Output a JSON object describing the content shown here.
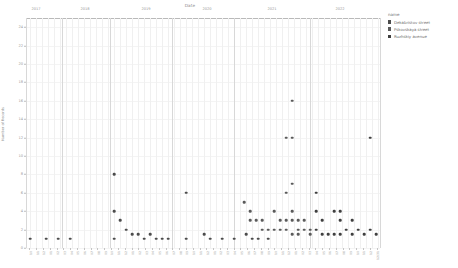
{
  "chart_title": "Date",
  "legend": {
    "title": "name",
    "items": [
      {
        "label": "Dekabristov street",
        "color": "#4c4c4c"
      },
      {
        "label": "Pskovskaya street",
        "color": "#5a5a5a"
      },
      {
        "label": "Ruzhskiy avenue",
        "color": "#3f3f3f"
      }
    ]
  },
  "chart_data": {
    "type": "scatter",
    "title": "Date",
    "xlabel": "Date",
    "ylabel": "Number of Records",
    "ylim": [
      0,
      25
    ],
    "grid": true,
    "legend_position": "right",
    "y_ticks": [
      0,
      2,
      4,
      6,
      8,
      10,
      12,
      14,
      16,
      18,
      20,
      22,
      24
    ],
    "year_labels": [
      "2017",
      "2018",
      "2019",
      "2020",
      "2021",
      "2022"
    ],
    "year_label_x": [
      36,
      85,
      146,
      207,
      272,
      340
    ],
    "year_separator_x": [
      26,
      62,
      110,
      172,
      234,
      310,
      380
    ],
    "x_tick_labels": [
      "10",
      "11",
      "12",
      "01",
      "02",
      "03",
      "04",
      "05",
      "06",
      "07",
      "08",
      "09",
      "10",
      "11",
      "12",
      "01",
      "02",
      "03",
      "04",
      "05",
      "06",
      "07",
      "08",
      "09",
      "10",
      "11",
      "12",
      "01",
      "02",
      "03",
      "04",
      "05",
      "06",
      "07",
      "08",
      "09",
      "10",
      "11",
      "12",
      "01",
      "02",
      "03",
      "04",
      "05",
      "06",
      "07",
      "08",
      "09",
      "10",
      "11",
      "12",
      "12/31"
    ],
    "series": [
      {
        "name": "Dekabristov street",
        "color": "#4c4c4c",
        "points": [
          {
            "x": 30,
            "y": 1
          },
          {
            "x": 46,
            "y": 1
          },
          {
            "x": 58,
            "y": 1
          },
          {
            "x": 70,
            "y": 1
          },
          {
            "x": 114,
            "y": 8
          },
          {
            "x": 114,
            "y": 4
          },
          {
            "x": 114,
            "y": 1
          },
          {
            "x": 120,
            "y": 3
          },
          {
            "x": 126,
            "y": 2
          },
          {
            "x": 132,
            "y": 1.5
          },
          {
            "x": 138,
            "y": 1.5
          },
          {
            "x": 144,
            "y": 1
          },
          {
            "x": 150,
            "y": 1.5
          },
          {
            "x": 156,
            "y": 1
          },
          {
            "x": 162,
            "y": 1
          },
          {
            "x": 168,
            "y": 1
          },
          {
            "x": 186,
            "y": 6
          },
          {
            "x": 186,
            "y": 1
          },
          {
            "x": 204,
            "y": 1.5
          },
          {
            "x": 210,
            "y": 1
          },
          {
            "x": 222,
            "y": 1
          },
          {
            "x": 234,
            "y": 1
          },
          {
            "x": 246,
            "y": 1.5
          },
          {
            "x": 252,
            "y": 1
          },
          {
            "x": 258,
            "y": 1
          },
          {
            "x": 268,
            "y": 1
          }
        ]
      },
      {
        "name": "Pskovskaya street",
        "color": "#5a5a5a",
        "points": [
          {
            "x": 244,
            "y": 5
          },
          {
            "x": 250,
            "y": 4
          },
          {
            "x": 250,
            "y": 3
          },
          {
            "x": 256,
            "y": 3
          },
          {
            "x": 262,
            "y": 3
          },
          {
            "x": 262,
            "y": 2
          },
          {
            "x": 268,
            "y": 2
          },
          {
            "x": 274,
            "y": 4
          },
          {
            "x": 274,
            "y": 2
          },
          {
            "x": 280,
            "y": 3
          },
          {
            "x": 280,
            "y": 2
          },
          {
            "x": 286,
            "y": 12
          },
          {
            "x": 286,
            "y": 6
          },
          {
            "x": 286,
            "y": 3
          },
          {
            "x": 286,
            "y": 2
          },
          {
            "x": 292,
            "y": 16
          },
          {
            "x": 292,
            "y": 12
          },
          {
            "x": 292,
            "y": 7
          },
          {
            "x": 292,
            "y": 4
          },
          {
            "x": 292,
            "y": 3
          },
          {
            "x": 292,
            "y": 1.5
          },
          {
            "x": 298,
            "y": 3
          },
          {
            "x": 298,
            "y": 2
          },
          {
            "x": 298,
            "y": 1.5
          },
          {
            "x": 304,
            "y": 3
          },
          {
            "x": 304,
            "y": 2
          },
          {
            "x": 310,
            "y": 2
          },
          {
            "x": 310,
            "y": 1.5
          }
        ]
      },
      {
        "name": "Ruzhskiy avenue",
        "color": "#3f3f3f",
        "points": [
          {
            "x": 316,
            "y": 6
          },
          {
            "x": 316,
            "y": 4
          },
          {
            "x": 316,
            "y": 2
          },
          {
            "x": 322,
            "y": 3
          },
          {
            "x": 322,
            "y": 1.5
          },
          {
            "x": 328,
            "y": 1.5
          },
          {
            "x": 334,
            "y": 4
          },
          {
            "x": 334,
            "y": 1.5
          },
          {
            "x": 340,
            "y": 4
          },
          {
            "x": 340,
            "y": 3
          },
          {
            "x": 340,
            "y": 1.5
          },
          {
            "x": 346,
            "y": 2
          },
          {
            "x": 352,
            "y": 3
          },
          {
            "x": 352,
            "y": 1.5
          },
          {
            "x": 358,
            "y": 2
          },
          {
            "x": 364,
            "y": 1.5
          },
          {
            "x": 370,
            "y": 12
          },
          {
            "x": 370,
            "y": 2
          },
          {
            "x": 376,
            "y": 1.5
          }
        ]
      }
    ]
  }
}
